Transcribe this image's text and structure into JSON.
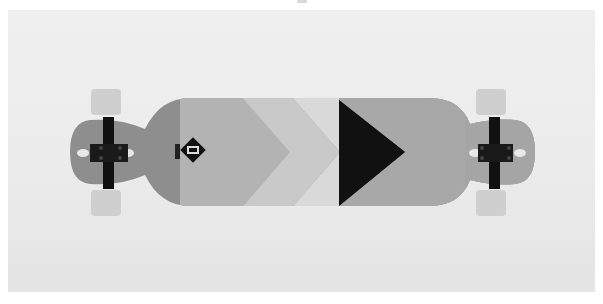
{
  "image": {
    "subject": "longboard skateboard, top view",
    "colors": {
      "background": "#ececec",
      "deck_dark_gray": "#8c8c8c",
      "deck_mid_gray": "#a9a9a9",
      "deck_light_gray": "#c8c8c8",
      "deck_lighter": "#d6d6d6",
      "black": "#111111",
      "wheel": "#c9c9c9"
    }
  }
}
